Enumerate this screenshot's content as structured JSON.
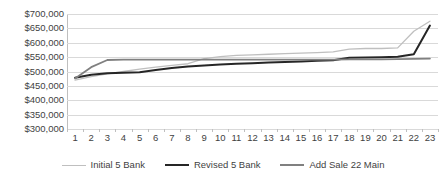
{
  "chart_data": {
    "type": "line",
    "title": "",
    "xlabel": "",
    "ylabel": "",
    "ylim": [
      300000,
      700000
    ],
    "ytick_step": 50000,
    "ytick_labels": [
      "$700,000",
      "$650,000",
      "$600,000",
      "$550,000",
      "$500,000",
      "$450,000",
      "$400,000",
      "$350,000",
      "$300,000"
    ],
    "ytick_values": [
      700000,
      650000,
      600000,
      550000,
      500000,
      450000,
      400000,
      350000,
      300000
    ],
    "grid": true,
    "legend_position": "bottom",
    "x": [
      1,
      2,
      3,
      4,
      5,
      6,
      7,
      8,
      9,
      10,
      11,
      12,
      13,
      14,
      15,
      16,
      17,
      18,
      19,
      20,
      21,
      22,
      23
    ],
    "xtick_labels": [
      "1",
      "2",
      "3",
      "4",
      "5",
      "6",
      "7",
      "8",
      "9",
      "10",
      "11",
      "12",
      "13",
      "14",
      "15",
      "16",
      "17",
      "18",
      "19",
      "20",
      "21",
      "22",
      "23"
    ],
    "series": [
      {
        "name": "Initial  5 Bank",
        "color": "#bfbfbf",
        "width": 1.3,
        "values": [
          470000,
          482000,
          492000,
          500000,
          508000,
          515000,
          521000,
          527000,
          545000,
          552000,
          556000,
          558000,
          560000,
          562000,
          564000,
          566000,
          568000,
          578000,
          580000,
          580000,
          582000,
          640000,
          675000
        ]
      },
      {
        "name": "Revised 5 Bank",
        "color": "#262626",
        "width": 2.0,
        "values": [
          478000,
          489000,
          494000,
          496000,
          497000,
          505000,
          512000,
          517000,
          521000,
          524000,
          527000,
          529000,
          531000,
          533000,
          535000,
          537000,
          539000,
          548000,
          549000,
          550000,
          551000,
          560000,
          660000
        ]
      },
      {
        "name": "Add Sale 22 Main",
        "color": "#808080",
        "width": 1.8,
        "values": [
          476000,
          515000,
          540000,
          541000,
          541000,
          541000,
          541000,
          541000,
          541000,
          541000,
          541000,
          541000,
          541000,
          541000,
          541000,
          541000,
          541000,
          542000,
          542000,
          542000,
          543000,
          544000,
          545000
        ]
      }
    ]
  },
  "legend": {
    "items": [
      {
        "label": "Initial  5 Bank"
      },
      {
        "label": "Revised 5 Bank"
      },
      {
        "label": "Add Sale 22 Main"
      }
    ]
  }
}
